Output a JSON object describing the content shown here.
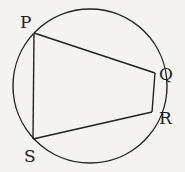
{
  "diagram": {
    "type": "cyclic-quadrilateral",
    "circle": {
      "cx": 90,
      "cy": 86,
      "r": 77
    },
    "points": {
      "P": {
        "label": "P",
        "x": 34,
        "y": 33,
        "lx": 20,
        "ly": 28
      },
      "Q": {
        "label": "Q",
        "x": 155,
        "y": 73,
        "lx": 159,
        "ly": 80
      },
      "R": {
        "label": "R",
        "x": 152,
        "y": 112,
        "lx": 159,
        "ly": 124
      },
      "S": {
        "label": "S",
        "x": 33,
        "y": 139,
        "lx": 24,
        "ly": 162
      }
    },
    "edges": [
      [
        "P",
        "Q"
      ],
      [
        "Q",
        "R"
      ],
      [
        "R",
        "S"
      ],
      [
        "S",
        "P"
      ]
    ],
    "stroke_color": "#222222"
  }
}
